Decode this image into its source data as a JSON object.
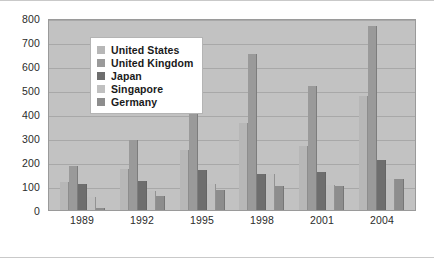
{
  "chart_data": {
    "type": "bar",
    "title": "",
    "subtitle": "",
    "xlabel": "",
    "ylabel": "",
    "categories": [
      "1989",
      "1992",
      "1995",
      "1998",
      "2001",
      "2004"
    ],
    "series": [
      {
        "name": "United States",
        "color": "#b7b7b7",
        "values": [
          115,
          170,
          248,
          362,
          265,
          475
        ]
      },
      {
        "name": "United Kingdom",
        "color": "#9a9a9a",
        "values": [
          185,
          293,
          475,
          650,
          518,
          768
        ]
      },
      {
        "name": "Japan",
        "color": "#6e6e6e",
        "values": [
          110,
          122,
          168,
          148,
          157,
          210
        ]
      },
      {
        "name": "Singapore",
        "color": "#c0c0c0",
        "values": [
          55,
          80,
          108,
          148,
          105,
          130
        ]
      },
      {
        "name": "Germany",
        "color": "#8d8d8d",
        "values": [
          8,
          58,
          83,
          100,
          100,
          128
        ]
      }
    ],
    "ylim": [
      0,
      800
    ],
    "yticks": [
      0,
      100,
      200,
      300,
      400,
      500,
      600,
      700,
      800
    ],
    "ytick_labels": [
      "0",
      "100",
      "200",
      "300",
      "400",
      "500",
      "600",
      "700",
      "800"
    ],
    "grid": true,
    "legend_position": "upper-left-inside",
    "plot_background": "#c2c2c2",
    "figure_background": "#ffffff",
    "gridline_color": "#a8a8a8",
    "axis_text_color": "#2b2b2b"
  }
}
